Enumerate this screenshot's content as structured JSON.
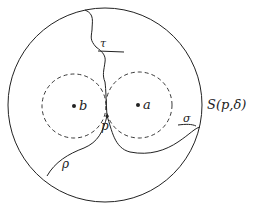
{
  "figure": {
    "labels": {
      "tau": "τ",
      "b": "b",
      "a": "a",
      "p": "p",
      "sigma": "σ",
      "rho": "ρ",
      "sphere": "S(p,δ)"
    },
    "colors": {
      "stroke": "#222222",
      "background": "#ffffff"
    }
  }
}
